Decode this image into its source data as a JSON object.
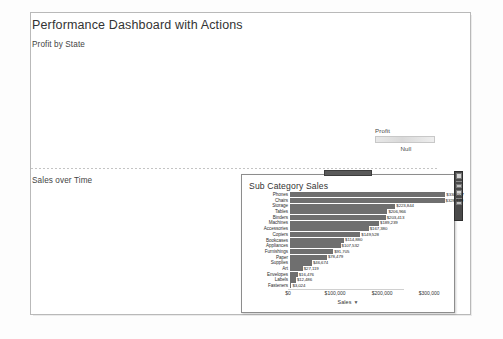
{
  "dashboard": {
    "title": "Performance Dashboard with Actions",
    "sheet1_title": "Profit by State",
    "sheet2_title": "Sales over Time"
  },
  "legend": {
    "title": "Profit",
    "null_label": "Null",
    "ramp_from": "#e8e8e8",
    "ramp_to": "#eeeeee"
  },
  "popup": {
    "title": "Sub Category Sales",
    "handle_name": "drag-handle",
    "toolbar": {
      "buttons": [
        "close-icon",
        "keep-only-icon",
        "exclude-icon",
        "view-data-icon"
      ]
    }
  },
  "chart_data": {
    "type": "bar",
    "title": "Sub Category Sales",
    "orientation": "horizontal",
    "xlabel": "Sales",
    "ylabel": "",
    "xlim": [
      0,
      340000
    ],
    "grid": false,
    "legend": "none",
    "sort": "descending",
    "tick_labels": [
      "$0",
      "$100,000",
      "$200,000",
      "$300,000"
    ],
    "tick_values": [
      0,
      100000,
      200000,
      300000
    ],
    "axis_title_sort_indicator": "▼",
    "categories": [
      "Phones",
      "Chairs",
      "Storage",
      "Tables",
      "Binders",
      "Machines",
      "Accessories",
      "Copiers",
      "Bookcases",
      "Appliances",
      "Furnishings",
      "Paper",
      "Supplies",
      "Art",
      "Envelopes",
      "Labels",
      "Fasteners"
    ],
    "values": [
      330007,
      328449,
      223844,
      206966,
      203413,
      189239,
      167380,
      149528,
      114880,
      107532,
      91705,
      78479,
      46674,
      27119,
      16476,
      12486,
      3024
    ],
    "value_labels": [
      "$330,007",
      "$328,449",
      "$223,844",
      "$206,966",
      "$203,413",
      "$189,239",
      "$167,380",
      "$149,528",
      "$114,880",
      "$107,532",
      "$91,705",
      "$78,479",
      "$46,674",
      "$27,119",
      "$16,476",
      "$12,486",
      "$3,024"
    ],
    "bar_color": "#6f6f6f"
  }
}
